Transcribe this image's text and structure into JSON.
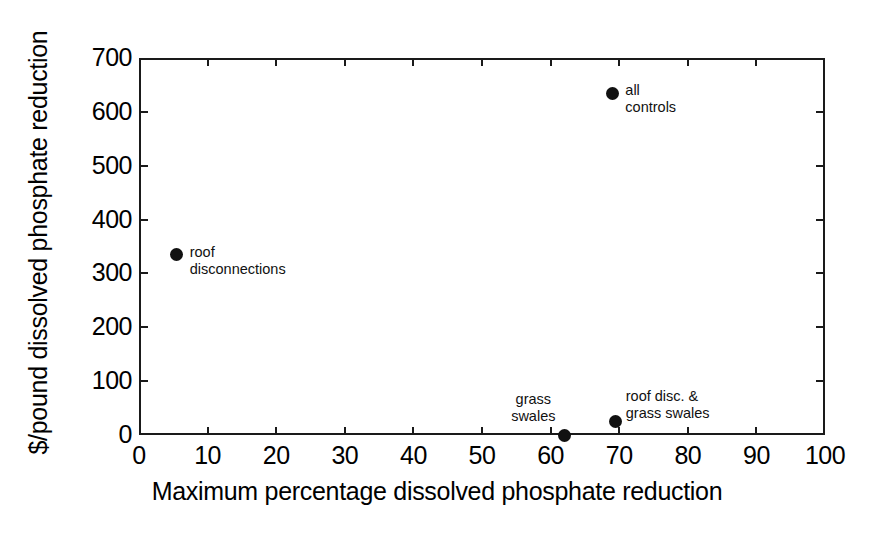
{
  "chart_data": {
    "type": "scatter",
    "title": "",
    "xlabel": "Maximum percentage dissolved phosphate reduction",
    "ylabel": "$/pound dissolved phosphate reduction",
    "xlim": [
      0,
      100
    ],
    "ylim": [
      0,
      700
    ],
    "xticks": [
      0,
      10,
      20,
      30,
      40,
      50,
      60,
      70,
      80,
      90,
      100
    ],
    "yticks": [
      0,
      100,
      200,
      300,
      400,
      500,
      600,
      700
    ],
    "xtick_labels": [
      "0",
      "10",
      "20",
      "30",
      "40",
      "50",
      "60",
      "70",
      "80",
      "90",
      "100"
    ],
    "ytick_labels": [
      "0",
      "100",
      "200",
      "300",
      "400",
      "500",
      "600",
      "700"
    ],
    "grid": false,
    "legend": "none",
    "marker": "filled-circle",
    "marker_color": "#111111",
    "points": [
      {
        "label": "roof\ndisconnections",
        "label_text": "roof disconnections",
        "x": 5.5,
        "y": 335,
        "label_position": "right"
      },
      {
        "label": "all\ncontrols",
        "label_text": "all controls",
        "x": 69,
        "y": 635,
        "label_position": "right"
      },
      {
        "label": "grass\nswales",
        "label_text": "grass swales",
        "x": 62,
        "y": 0,
        "label_position": "above-left"
      },
      {
        "label": "roof disc. &\ngrass swales",
        "label_text": "roof disc. & grass swales",
        "x": 69.5,
        "y": 25,
        "label_position": "above-right"
      }
    ]
  },
  "axes": {
    "x_title": "Maximum percentage dissolved phosphate reduction",
    "y_title": "$/pound dissolved phosphate reduction"
  },
  "labels": {
    "roof_disconnections": "roof\ndisconnections",
    "all_controls": "all\ncontrols",
    "grass_swales": "grass\nswales",
    "roof_disc_grass_swales": "roof disc. &\ngrass swales"
  },
  "colors": {
    "marker": "#111111",
    "axis": "#1a1a1a",
    "background": "#ffffff"
  }
}
